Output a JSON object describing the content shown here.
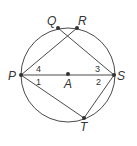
{
  "diagram": {
    "type": "circle-geometry",
    "circle": {
      "center_label": "A",
      "cx": 68,
      "cy": 75,
      "r": 47
    },
    "points": {
      "P": {
        "label": "P",
        "x": 21,
        "y": 75
      },
      "Q": {
        "label": "Q",
        "x": 58,
        "y": 28
      },
      "R": {
        "label": "R",
        "x": 77,
        "y": 28
      },
      "S": {
        "label": "S",
        "x": 114,
        "y": 75
      },
      "T": {
        "label": "T",
        "x": 84,
        "y": 118
      },
      "A": {
        "label": "A",
        "x": 68,
        "y": 75
      }
    },
    "segments": [
      [
        "P",
        "S"
      ],
      [
        "P",
        "R"
      ],
      [
        "Q",
        "S"
      ],
      [
        "P",
        "T"
      ],
      [
        "S",
        "T"
      ],
      [
        "Q",
        "R"
      ]
    ],
    "angle_labels": {
      "angle1": "1",
      "angle2": "2",
      "angle3": "3",
      "angle4": "4"
    }
  }
}
